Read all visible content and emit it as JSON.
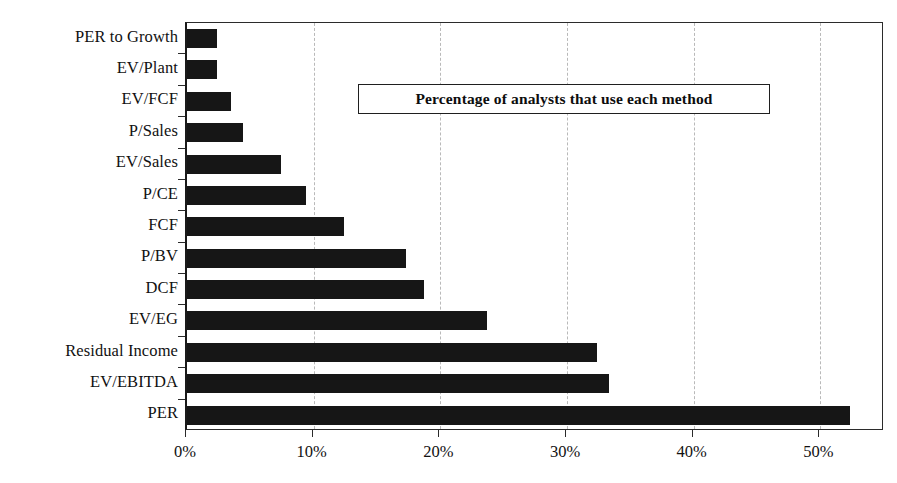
{
  "chart_data": {
    "type": "bar",
    "orientation": "horizontal",
    "title": "",
    "legend_note": "Percentage of analysts that use each method",
    "legend_position": "inside-top-right",
    "xlabel": "",
    "ylabel": "",
    "xlim": [
      0,
      55.1
    ],
    "grid": true,
    "grid_axis": "x",
    "bar_color": "#161616",
    "categories": [
      "PER to Growth",
      "EV/Plant",
      "EV/FCF",
      "P/Sales",
      "EV/Sales",
      "P/CE",
      "FCF",
      "P/BV",
      "DCF",
      "EV/EG",
      "Residual Income",
      "EV/EBITDA",
      "PER"
    ],
    "values": [
      2.4,
      2.4,
      3.5,
      4.4,
      7.4,
      9.4,
      12.4,
      17.3,
      18.7,
      23.7,
      32.4,
      33.3,
      52.3
    ],
    "xticks": [
      0,
      10,
      20,
      30,
      40,
      50
    ],
    "xtick_labels": [
      "0%",
      "10%",
      "20%",
      "30%",
      "40%",
      "50%"
    ],
    "gridline_values": [
      10,
      20,
      30,
      40,
      50
    ]
  }
}
